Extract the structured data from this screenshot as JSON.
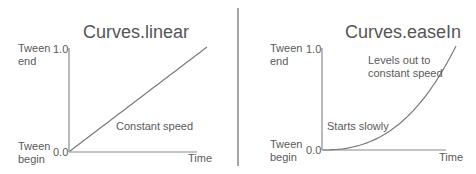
{
  "left": {
    "title": "Curves.linear",
    "y_top_label": "Tween\nend",
    "y_bottom_label": "Tween\nbegin",
    "y_top_tick": "1.0",
    "y_bottom_tick": "0.0",
    "x_label": "Time",
    "annotation": "Constant speed",
    "curve": "linear"
  },
  "right": {
    "title": "Curves.easeIn",
    "y_top_label": "Tween\nend",
    "y_bottom_label": "Tween\nbegin",
    "y_top_tick": "1.0",
    "y_bottom_tick": "0.0",
    "x_label": "Time",
    "annotation_top": "Levels out to\nconstant speed",
    "annotation_bottom": "Starts slowly",
    "curve": "easeIn"
  },
  "colors": {
    "axis": "#8a8a8a",
    "curve": "#7a7a7a",
    "divider": "#777777"
  }
}
